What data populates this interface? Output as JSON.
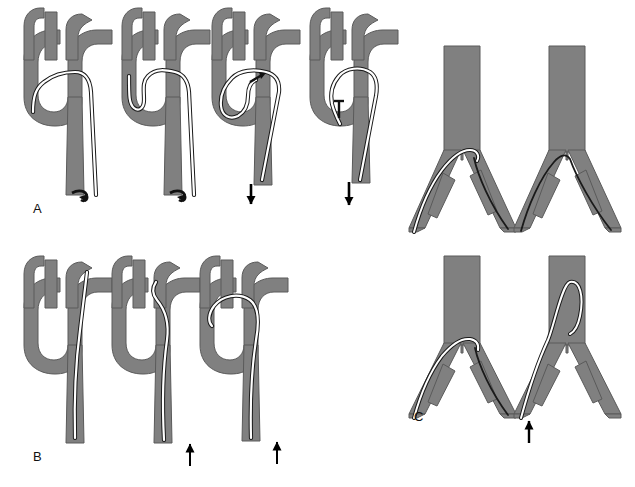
{
  "figure": {
    "background_color": "#ffffff",
    "vessel_fill_color": "#808080",
    "vessel_outline_color": "#5a5a5a",
    "catheter_fill_color": "#ffffff",
    "catheter_outline_color": "#1a1a1a",
    "guidewire_color": "#1a1a1a",
    "arrow_color": "#000000",
    "label_color": "#111111"
  },
  "panels": [
    {
      "id": "panel-a",
      "label": "A",
      "label_x": 33,
      "label_y": 213,
      "description": "Aortic arch catheter loop formation, antegrade advancement into descending aorta",
      "figures": [
        {
          "id": "a1",
          "order": 1,
          "caption": "Catheter passed retrograde over the arch into the brachiocephalic trunk",
          "catheter_tip_marker": true,
          "arrow": null
        },
        {
          "id": "a2",
          "order": 2,
          "caption": "Catheter tip formed into a small loop at the origin of the brachiocephalic trunk",
          "catheter_tip_marker": true,
          "arrow": null
        },
        {
          "id": "a3",
          "order": 3,
          "caption": "Large loop formed within the aortic arch, tip directed cranially",
          "catheter_tip_marker": true,
          "arrow": {
            "direction": "down",
            "x": 251,
            "y_top": 183,
            "y_bottom": 213
          }
        },
        {
          "id": "a4",
          "order": 4,
          "caption": "Loop withdrawn and catheter advanced down the descending aorta",
          "catheter_tip_marker": true,
          "arrow": {
            "direction": "down",
            "x": 349,
            "y_top": 180,
            "y_bottom": 214
          }
        }
      ]
    },
    {
      "id": "panel-b",
      "label": "B",
      "label_x": 33,
      "label_y": 461,
      "description": "Retrograde catheter advancement from the descending aorta into the arch branches",
      "figures": [
        {
          "id": "b1",
          "order": 1,
          "caption": "Catheter advanced from below into the left subclavian artery",
          "catheter_tip_marker": false,
          "arrow": null
        },
        {
          "id": "b2",
          "order": 2,
          "caption": "Catheter advanced further with tip approaching the arch branch origin",
          "catheter_tip_marker": false,
          "arrow": {
            "direction": "up",
            "x": 190,
            "y_top": 432,
            "y_bottom": 466
          }
        },
        {
          "id": "b3",
          "order": 3,
          "caption": "Catheter looped across the arch toward the brachiocephalic trunk",
          "catheter_tip_marker": false,
          "arrow": {
            "direction": "up",
            "x": 277,
            "y_top": 428,
            "y_bottom": 464
          }
        }
      ]
    },
    {
      "id": "panel-c",
      "label": "C",
      "label_x": 414,
      "label_y": 421,
      "description": "Aortoiliac bifurcation crossover technique using catheter and guidewire",
      "figures": [
        {
          "id": "c1",
          "order": 1,
          "caption": "Catheter hooked over the aortic bifurcation with guidewire advanced down the contralateral iliac artery",
          "has_catheter": true,
          "has_guidewire": true,
          "arrow": null
        },
        {
          "id": "c2",
          "order": 2,
          "caption": "Guidewire alone left in place across the bifurcation after catheter removal",
          "has_catheter": false,
          "has_guidewire": true,
          "arrow": null
        },
        {
          "id": "c3",
          "order": 3,
          "caption": "Catheter advanced over the bifurcation with guidewire within the contralateral iliac artery",
          "has_catheter": true,
          "has_guidewire": true,
          "arrow": null
        },
        {
          "id": "c4",
          "order": 4,
          "caption": "Catheter re-formed into a shepherd hook loop in the distal aorta",
          "has_catheter": true,
          "has_guidewire": false,
          "arrow": {
            "direction": "up",
            "x": 529,
            "y_top": 412,
            "y_bottom": 443
          }
        }
      ]
    }
  ]
}
